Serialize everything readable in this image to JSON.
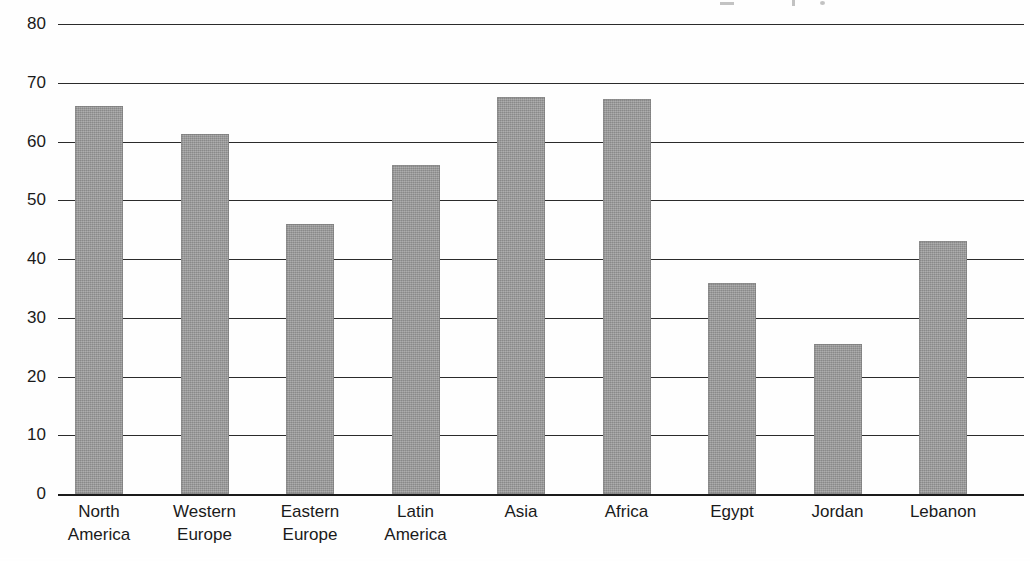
{
  "chart_data": {
    "type": "bar",
    "title": "",
    "subtitle": "",
    "xlabel": "",
    "ylabel": "",
    "ylim": [
      0,
      80
    ],
    "yticks": [
      0,
      10,
      20,
      30,
      40,
      50,
      60,
      70,
      80
    ],
    "ytick_labels": [
      "0",
      "10",
      "20",
      "30",
      "40",
      "50",
      "60",
      "70",
      "80"
    ],
    "grid": true,
    "legend": false,
    "legend_position": "none",
    "bar_color": "#969696",
    "axis_color": "#1a1a1a",
    "background_color": "#ffffff",
    "categories": [
      "North America",
      "Western Europe",
      "Eastern Europe",
      "Latin America",
      "Asia",
      "Africa",
      "Egypt",
      "Jordan",
      "Lebanon"
    ],
    "category_lines": [
      [
        "North",
        "America"
      ],
      [
        "Western",
        "Europe"
      ],
      [
        "Eastern",
        "Europe"
      ],
      [
        "Latin",
        "America"
      ],
      [
        "Asia",
        ""
      ],
      [
        "Africa",
        ""
      ],
      [
        "Egypt",
        ""
      ],
      [
        "Jordan",
        ""
      ],
      [
        "Lebanon",
        ""
      ]
    ],
    "values": [
      66,
      61.3,
      46,
      56,
      67.5,
      67.2,
      36,
      25.5,
      43
    ],
    "series": [
      {
        "name": "",
        "values": [
          66,
          61.3,
          46,
          56,
          67.5,
          67.2,
          36,
          25.5,
          43
        ]
      }
    ]
  }
}
